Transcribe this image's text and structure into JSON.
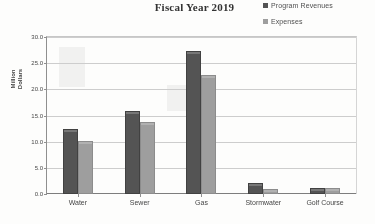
{
  "title": "Fiscal Year 2019",
  "legend": {
    "items": [
      {
        "label": "Program Revenues",
        "color": "#4e4e4e",
        "swatch_name": "legend-swatch-program-revenues"
      },
      {
        "label": "Expenses",
        "color": "#9d9d9d",
        "swatch_name": "legend-swatch-expenses"
      }
    ]
  },
  "y_axis": {
    "title_line1": "Million",
    "title_line2": "Dollars",
    "ticks": [
      "30.0",
      "25.0",
      "20.0",
      "15.0",
      "10.0",
      "5.0",
      "0.0"
    ]
  },
  "chart_data": {
    "type": "bar",
    "title": "Fiscal Year 2019",
    "xlabel": "",
    "ylabel": "Million Dollars",
    "ylim": [
      0,
      30
    ],
    "ytick_step": 5,
    "grid": true,
    "legend_position": "top-right",
    "categories": [
      "Water",
      "Sewer",
      "Gas",
      "Stormwater",
      "Golf Course"
    ],
    "series": [
      {
        "name": "Program Revenues",
        "color": "#4e4e4e",
        "values": [
          12.0,
          15.5,
          27.0,
          1.8,
          0.7
        ]
      },
      {
        "name": "Expenses",
        "color": "#9d9d9d",
        "values": [
          9.8,
          13.4,
          22.4,
          0.6,
          0.8
        ]
      }
    ]
  }
}
